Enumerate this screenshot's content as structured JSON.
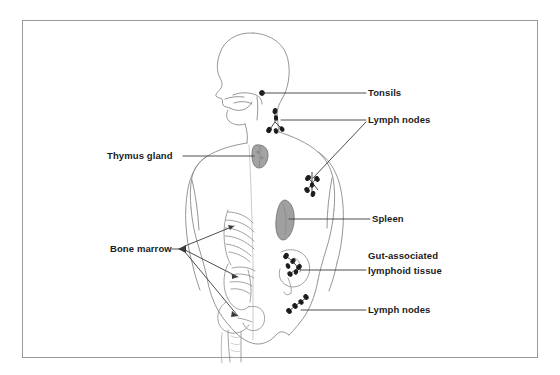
{
  "figure": {
    "border_color": "#9a9a9a",
    "background_color": "#ffffff",
    "line_color": "#3a3a3a",
    "body_outline_color": "#7d7d7d",
    "organ_fill_color": "#9b9b9b",
    "node_color": "#1b1b1b",
    "text_color": "#1b1b1b"
  },
  "labels": {
    "tonsils": "Tonsils",
    "lymph_nodes_upper": "Lymph nodes",
    "thymus_gland": "Thymus gland",
    "spleen": "Spleen",
    "galt_line1": "Gut-associated",
    "galt_line2": "lymphoid tissue",
    "lymph_nodes_lower": "Lymph nodes",
    "bone_marrow": "Bone marrow"
  },
  "annotations": [
    {
      "id": "tonsils",
      "label": "Tonsils",
      "side": "right",
      "label_x": 368,
      "label_y": 87,
      "leader_from_x": 262,
      "leader_from_y": 93,
      "leader_to_x": 365,
      "leader_to_y": 93,
      "marker": "dot"
    },
    {
      "id": "lymph-nodes-upper",
      "label": "Lymph nodes",
      "side": "right",
      "label_x": 368,
      "label_y": 114,
      "leader_from_x": 280,
      "leader_from_y": 120,
      "leader_to_x": 365,
      "leader_to_y": 120,
      "marker": "node-cluster",
      "second_leader_from_x": 310,
      "second_leader_from_y": 178,
      "second_leader_to_x": 365,
      "second_leader_to_y": 122
    },
    {
      "id": "thymus-gland",
      "label": "Thymus gland",
      "side": "left",
      "label_x": 108,
      "label_y": 149,
      "leader_from_x": 183,
      "leader_from_y": 156,
      "leader_to_x": 255,
      "leader_to_y": 156,
      "marker": "organ"
    },
    {
      "id": "spleen",
      "label": "Spleen",
      "side": "right",
      "label_x": 372,
      "label_y": 212,
      "leader_from_x": 292,
      "leader_from_y": 218,
      "leader_to_x": 369,
      "leader_to_y": 218,
      "marker": "organ"
    },
    {
      "id": "gut-associated-lymphoid-tissue",
      "label": "Gut-associated lymphoid tissue",
      "side": "right",
      "label_x": 368,
      "label_y": 249,
      "leader_from_x": 300,
      "leader_from_y": 271,
      "leader_to_x": 365,
      "leader_to_y": 271,
      "marker": "node-cluster"
    },
    {
      "id": "lymph-nodes-lower",
      "label": "Lymph nodes",
      "side": "right",
      "label_x": 368,
      "label_y": 304,
      "leader_from_x": 300,
      "leader_from_y": 310,
      "leader_to_x": 365,
      "leader_to_y": 310,
      "marker": "node-cluster"
    },
    {
      "id": "bone-marrow",
      "label": "Bone marrow",
      "side": "left",
      "label_x": 110,
      "label_y": 241,
      "leader_hub_x": 185,
      "leader_hub_y": 248,
      "targets": [
        {
          "name": "ribs",
          "x": 233,
          "y": 227
        },
        {
          "name": "vertebrae",
          "x": 238,
          "y": 276
        },
        {
          "name": "femur-pelvis",
          "x": 237,
          "y": 315
        }
      ],
      "marker": "multi-leader"
    }
  ],
  "organs": [
    {
      "name": "tonsil-dot",
      "type": "dot",
      "cx": 262,
      "cy": 93
    },
    {
      "name": "thymus-gland",
      "type": "shaded-organ",
      "cx": 261,
      "cy": 156
    },
    {
      "name": "spleen",
      "type": "shaded-organ",
      "cx": 286,
      "cy": 220
    },
    {
      "name": "cervical-lymph-nodes",
      "type": "node-cluster",
      "cx": 276,
      "cy": 122
    },
    {
      "name": "axillary-lymph-nodes",
      "type": "node-cluster",
      "cx": 313,
      "cy": 183
    },
    {
      "name": "gut-lymph-nodes",
      "type": "node-cluster",
      "cx": 292,
      "cy": 268
    },
    {
      "name": "inguinal-lymph-nodes",
      "type": "node-cluster",
      "cx": 297,
      "cy": 306
    }
  ],
  "body_parts": [
    {
      "name": "head-profile"
    },
    {
      "name": "neck"
    },
    {
      "name": "torso"
    },
    {
      "name": "left-arm"
    },
    {
      "name": "right-arm"
    },
    {
      "name": "ribs"
    },
    {
      "name": "spine-vertebrae"
    },
    {
      "name": "pelvis"
    },
    {
      "name": "femur"
    },
    {
      "name": "intestine"
    },
    {
      "name": "hips"
    }
  ]
}
